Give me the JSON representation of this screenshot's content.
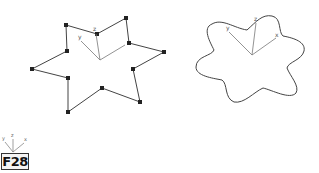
{
  "figure": {
    "label": "F28",
    "colors": {
      "stroke": "#444444",
      "vertex": "#222222",
      "axis": "#777777",
      "text": "#555555"
    },
    "left_shape": {
      "description": "six-point star polyline with vertex handles",
      "vertices": [
        [
          66,
          25
        ],
        [
          97,
          34
        ],
        [
          126,
          18
        ],
        [
          129,
          43
        ],
        [
          164,
          52
        ],
        [
          133,
          69
        ],
        [
          140,
          102
        ],
        [
          102,
          88
        ],
        [
          68,
          112
        ],
        [
          68,
          78
        ],
        [
          32,
          69
        ],
        [
          67,
          51
        ]
      ],
      "gizmo": {
        "origin": [
          100,
          60
        ],
        "x_end": [
          125,
          45
        ],
        "y_end": [
          80,
          40
        ],
        "z_end": [
          96,
          34
        ],
        "labels": {
          "x": "",
          "y": "y",
          "z": "z"
        }
      }
    },
    "right_shape": {
      "description": "smoothed six-lobe star (flower outline)",
      "gizmo": {
        "origin": [
          252,
          55
        ],
        "x_end": [
          276,
          38
        ],
        "y_end": [
          229,
          31
        ],
        "z_end": [
          256,
          23
        ],
        "labels": {
          "x": "x",
          "y": "y",
          "z": "z"
        }
      }
    },
    "corner_gizmo": {
      "labels": {
        "x": "x",
        "y": "y",
        "z": "z"
      }
    }
  }
}
